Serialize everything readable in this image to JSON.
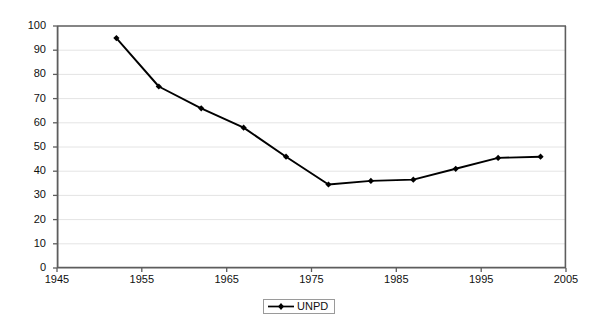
{
  "chart_data": {
    "type": "line",
    "title": "",
    "xlabel": "",
    "ylabel": "",
    "xlim": [
      1945,
      2005
    ],
    "ylim": [
      0,
      100
    ],
    "grid": true,
    "legend_position": "bottom-center",
    "x_ticks": [
      "1945",
      "1955",
      "1965",
      "1975",
      "1985",
      "1995",
      "2005"
    ],
    "x_tick_values": [
      1945,
      1955,
      1965,
      1975,
      1985,
      1995,
      2005
    ],
    "y_ticks": [
      "0",
      "10",
      "20",
      "30",
      "40",
      "50",
      "60",
      "70",
      "80",
      "90",
      "100"
    ],
    "y_tick_values": [
      0,
      10,
      20,
      30,
      40,
      50,
      60,
      70,
      80,
      90,
      100
    ],
    "series": [
      {
        "name": "UNPD",
        "color": "#000000",
        "marker": "diamond",
        "x": [
          1952,
          1957,
          1962,
          1967,
          1972,
          1977,
          1982,
          1987,
          1992,
          1997,
          2002
        ],
        "values": [
          95,
          75,
          66,
          58,
          46,
          34.5,
          36,
          36.5,
          41,
          45.5,
          46
        ]
      }
    ]
  },
  "legend": {
    "items": [
      {
        "label": "UNPD"
      }
    ]
  },
  "colors": {
    "line": "#000000",
    "grid": "#e4e4e4",
    "axis": "#595959",
    "background": "#ffffff",
    "text": "#101010"
  }
}
